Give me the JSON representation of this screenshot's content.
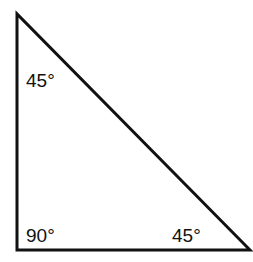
{
  "diagram": {
    "type": "right isosceles triangle",
    "stroke_color": "#111111",
    "background": "#ffffff",
    "vertices": {
      "top": {
        "x": 17,
        "y": 14
      },
      "bottom_left": {
        "x": 17,
        "y": 250
      },
      "bottom_right": {
        "x": 250,
        "y": 250
      }
    },
    "angles": [
      {
        "vertex": "top",
        "label": "45°",
        "x": 26,
        "y": 71
      },
      {
        "vertex": "bottom_left",
        "label": "90°",
        "x": 26,
        "y": 226
      },
      {
        "vertex": "bottom_right",
        "label": "45°",
        "x": 172,
        "y": 226
      }
    ]
  }
}
